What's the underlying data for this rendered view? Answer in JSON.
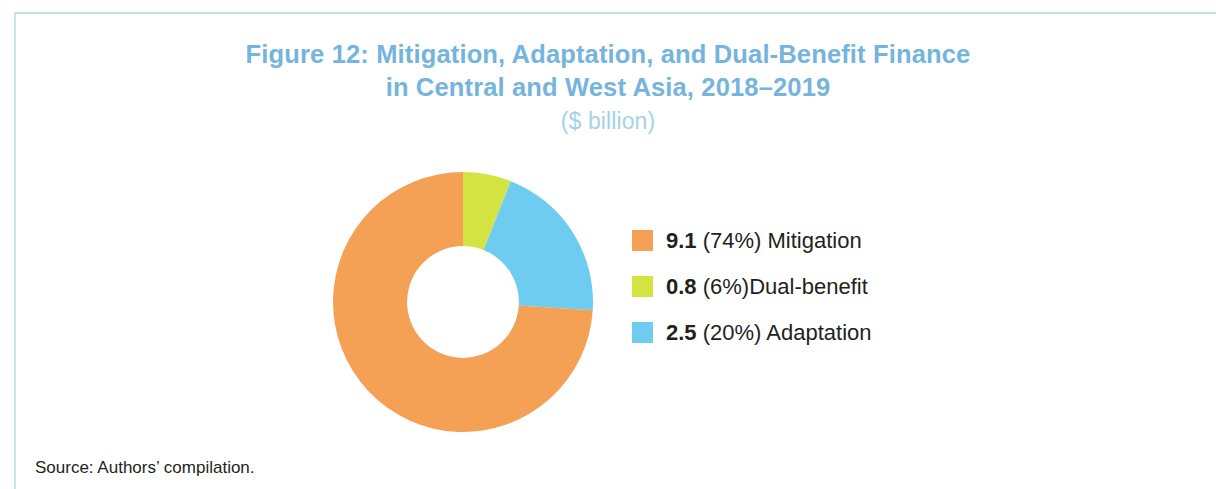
{
  "figure": {
    "title_line1": "Figure 12: Mitigation, Adaptation, and Dual-Benefit Finance",
    "title_line2": "in Central and West Asia, 2018–2019",
    "subtitle": "($ billion)",
    "source": "Source: Authors’ compilation.",
    "title_color": "#74b4dd",
    "subtitle_color": "#a5d2ea",
    "frame_color": "#b9e2ea"
  },
  "legend": [
    {
      "swatch_color": "#f4a055",
      "value": "9.1",
      "percent": " (74%) ",
      "label": "Mitigation"
    },
    {
      "swatch_color": "#d3e342",
      "value": "0.8",
      "percent": " (6%)",
      "label": "Dual-benefit"
    },
    {
      "swatch_color": "#6dccf0",
      "value": "2.5",
      "percent": " (20%) ",
      "label": "Adaptation"
    }
  ],
  "chart_data": {
    "type": "pie",
    "variant": "donut",
    "title": "Figure 12: Mitigation, Adaptation, and Dual-Benefit Finance in Central and West Asia, 2018–2019",
    "subtitle": "($ billion)",
    "unit": "$ billion",
    "start_angle_deg": 0,
    "direction": "clockwise",
    "inner_radius_ratio": 0.43,
    "legend_position": "right",
    "slice_order_from_top_clockwise": [
      "Dual-benefit",
      "Adaptation",
      "Mitigation"
    ],
    "categories": [
      "Mitigation",
      "Dual-benefit",
      "Adaptation"
    ],
    "values": [
      9.1,
      0.8,
      2.5
    ],
    "percents": [
      74,
      6,
      20
    ],
    "colors": [
      "#f4a055",
      "#d3e342",
      "#6dccf0"
    ],
    "slices": [
      {
        "name": "Mitigation",
        "value": 9.1,
        "percent": 74,
        "color": "#f4a055"
      },
      {
        "name": "Dual-benefit",
        "value": 0.8,
        "percent": 6,
        "color": "#d3e342"
      },
      {
        "name": "Adaptation",
        "value": 2.5,
        "percent": 20,
        "color": "#6dccf0"
      }
    ],
    "total": 12.4,
    "source": "Authors’ compilation."
  }
}
